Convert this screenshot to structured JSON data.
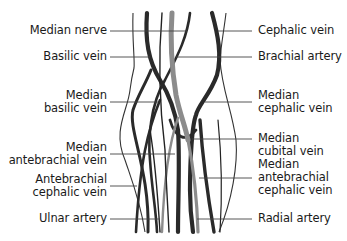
{
  "diagram": {
    "colors": {
      "vein": "#2a2a2a",
      "artery": "#8c8c8c",
      "outline": "#333333",
      "leader": "#444444",
      "text": "#1a1a1a",
      "background": "#ffffff"
    },
    "labels_left": [
      {
        "id": "median-nerve",
        "lines": [
          "Median nerve"
        ]
      },
      {
        "id": "basilic-vein",
        "lines": [
          "Basilic vein"
        ]
      },
      {
        "id": "median-basilic-vein",
        "lines": [
          "Median",
          "basilic vein"
        ]
      },
      {
        "id": "median-antebrachial-vein",
        "lines": [
          "Median",
          "antebrachial vein"
        ]
      },
      {
        "id": "antebrachial-cephalic-vein",
        "lines": [
          "Antebrachial",
          "cephalic vein"
        ]
      },
      {
        "id": "ulnar-artery",
        "lines": [
          "Ulnar artery"
        ]
      }
    ],
    "labels_right": [
      {
        "id": "cephalic-vein",
        "lines": [
          "Cephalic vein"
        ]
      },
      {
        "id": "brachial-artery",
        "lines": [
          "Brachial artery"
        ]
      },
      {
        "id": "median-cephalic-vein",
        "lines": [
          "Median",
          "cephalic vein"
        ]
      },
      {
        "id": "median-cubital-vein",
        "lines": [
          "Median",
          "cubital vein"
        ]
      },
      {
        "id": "median-antebrachial-cephalic-vein",
        "lines": [
          "Median",
          "antebrachial",
          "cephalic vein"
        ]
      },
      {
        "id": "radial-artery",
        "lines": [
          "Radial artery"
        ]
      }
    ]
  }
}
